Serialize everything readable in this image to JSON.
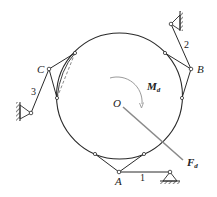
{
  "diagram": {
    "type": "mechanism",
    "colors": {
      "stroke": "#2a2a2a",
      "force": "#8a8a8a",
      "moment": "#9a9a9a",
      "background": "#ffffff"
    },
    "labels": {
      "center": "O",
      "moment": "M",
      "moment_sub": "d",
      "force": "F",
      "force_sub": "d",
      "joint_a": "A",
      "joint_b": "B",
      "joint_c": "C",
      "link_1": "1",
      "link_2": "2",
      "link_3": "3"
    }
  }
}
